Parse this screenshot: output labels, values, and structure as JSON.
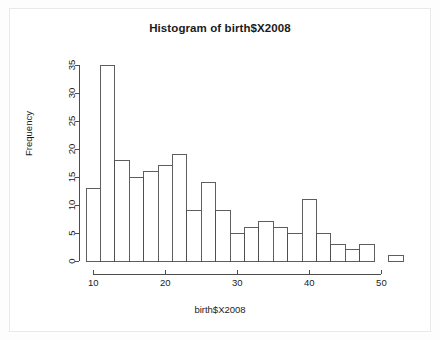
{
  "chart_data": {
    "type": "bar",
    "title": "Histogram of birth$X2008",
    "xlabel": "birth$X2008",
    "ylabel": "Frequency",
    "grid": false,
    "legend": null,
    "xlim": [
      9,
      53
    ],
    "ylim": [
      0,
      35
    ],
    "bin_width": 2,
    "xticks": [
      10,
      20,
      30,
      40,
      50
    ],
    "yticks": [
      0,
      5,
      10,
      15,
      20,
      25,
      30,
      35
    ],
    "bin_edges": [
      9,
      11,
      13,
      15,
      17,
      19,
      21,
      23,
      25,
      27,
      29,
      31,
      33,
      35,
      37,
      39,
      41,
      43,
      45,
      47,
      49,
      51,
      53
    ],
    "categories": [
      "9-11",
      "11-13",
      "13-15",
      "15-17",
      "17-19",
      "19-21",
      "21-23",
      "23-25",
      "25-27",
      "27-29",
      "29-31",
      "31-33",
      "33-35",
      "35-37",
      "37-39",
      "39-41",
      "41-43",
      "43-45",
      "45-47",
      "47-49",
      "49-51",
      "51-53"
    ],
    "values": [
      13,
      35,
      18,
      15,
      16,
      17,
      19,
      9,
      14,
      9,
      5,
      6,
      7,
      6,
      5,
      11,
      5,
      3,
      2,
      3,
      0,
      1
    ],
    "bar_fill": "#ffffff",
    "bar_stroke": "#4d4d4d",
    "axis_color": "#4d4d4d",
    "text_color": "#1b1b1b"
  }
}
